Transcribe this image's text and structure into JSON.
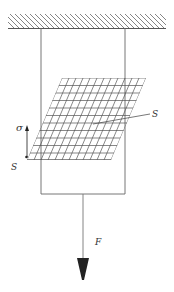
{
  "diagram": {
    "labels": {
      "stress": "σ",
      "shear_plane_right": "S",
      "shear_plane_left": "S",
      "force": "F"
    },
    "colors": {
      "line": "#555555",
      "arrowhead": "#222222",
      "background": "#ffffff"
    }
  }
}
